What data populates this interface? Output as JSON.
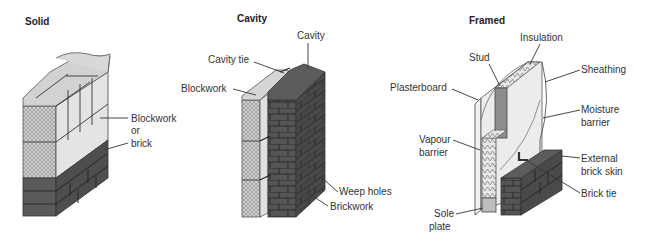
{
  "panels": [
    {
      "title": "Solid",
      "labels": {
        "blockwork": "Blockwork",
        "or": "or",
        "brick": "brick"
      }
    },
    {
      "title": "Cavity",
      "labels": {
        "cavity": "Cavity",
        "cavity_tie": "Cavity tie",
        "blockwork": "Blockwork",
        "weep_holes": "Weep holes",
        "brickwork": "Brickwork"
      }
    },
    {
      "title": "Framed",
      "labels": {
        "insulation": "Insulation",
        "stud": "Stud",
        "sheathing": "Sheathing",
        "plasterboard": "Plasterboard",
        "moisture_1": "Moisture",
        "moisture_2": "barrier",
        "vapour_1": "Vapour",
        "vapour_2": "barrier",
        "external_1": "External",
        "external_2": "brick skin",
        "brick_tie": "Brick tie",
        "sole_1": "Sole",
        "sole_2": "plate"
      }
    }
  ],
  "colors": {
    "block_face": "#e2e2e2",
    "block_top": "#cfcfcf",
    "hatch": "#bdbdbd",
    "brick_dark": "#4a4a4a",
    "brick_side": "#6a6a6a",
    "insulation": "#d8d8d8"
  }
}
